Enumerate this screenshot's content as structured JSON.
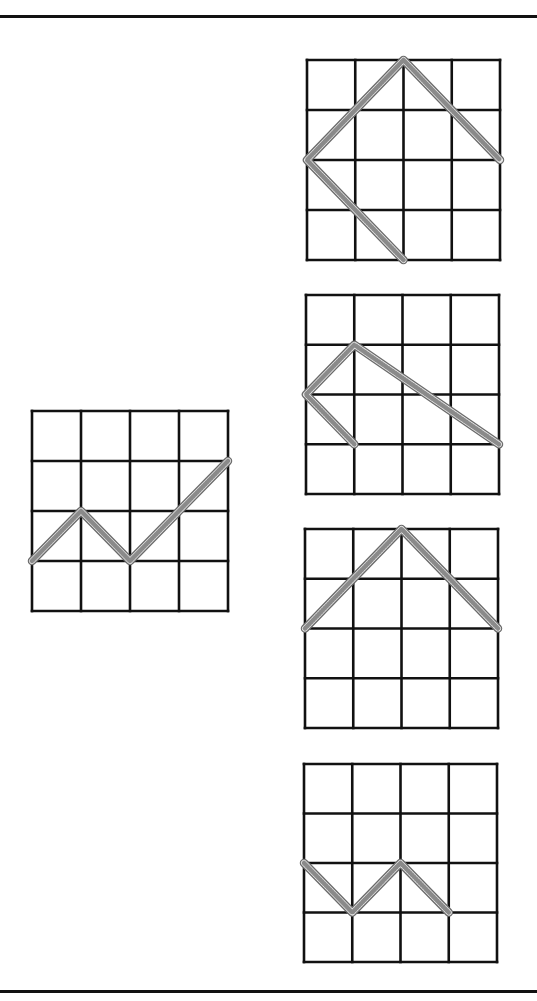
{
  "diagram": {
    "type": "rope-on-grid puzzle",
    "colors": {
      "grid_line": "#111111",
      "rope_outline": "#6a6a6a",
      "rope_fill": "#e6e6e6",
      "rope_hatch": "#8a8a8a",
      "background": "#ffffff",
      "rule": "#111111"
    },
    "grid_size": {
      "cols": 4,
      "rows": 4
    },
    "question_figure": {
      "label": "question",
      "rope_path": [
        [
          0,
          3
        ],
        [
          1,
          2
        ],
        [
          2,
          3
        ],
        [
          4,
          1
        ]
      ]
    },
    "answer_options": [
      {
        "label": "option-1",
        "rope_path": [
          [
            2,
            4
          ],
          [
            0,
            2
          ],
          [
            2,
            0
          ],
          [
            4,
            2
          ]
        ]
      },
      {
        "label": "option-2",
        "rope_path": [
          [
            1,
            3
          ],
          [
            0,
            2
          ],
          [
            1,
            1
          ],
          [
            4,
            3
          ]
        ]
      },
      {
        "label": "option-3",
        "rope_path": [
          [
            0,
            2
          ],
          [
            2,
            0
          ],
          [
            4,
            2
          ]
        ]
      },
      {
        "label": "option-4",
        "rope_path": [
          [
            0,
            2
          ],
          [
            1,
            3
          ],
          [
            2,
            2
          ],
          [
            3,
            3
          ]
        ]
      }
    ]
  }
}
